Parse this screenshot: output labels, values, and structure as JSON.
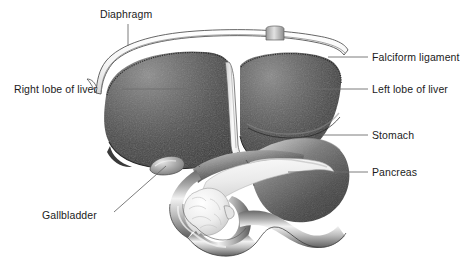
{
  "figure": {
    "background_color": "#ffffff",
    "label_color": "#1b1b1b",
    "leader_color": "#6d6d6d"
  },
  "labels": [
    {
      "id": "diaphragm",
      "text": "Diaphragm",
      "text_x": 100,
      "text_y": 18,
      "anchor": "start",
      "leader": "M128,24 L128,46"
    },
    {
      "id": "falciform-ligament",
      "text": "Falciform ligament",
      "text_x": 372,
      "text_y": 61,
      "anchor": "start",
      "leader": "M368,57 L328,57"
    },
    {
      "id": "right-lobe-of-liver",
      "text": "Right lobe of liver",
      "text_x": 14,
      "text_y": 93,
      "anchor": "start",
      "leader": "M122,89 L186,89"
    },
    {
      "id": "left-lobe-of-liver",
      "text": "Left lobe of liver",
      "text_x": 372,
      "text_y": 93,
      "anchor": "start",
      "leader": "M368,89 L308,89"
    },
    {
      "id": "stomach",
      "text": "Stomach",
      "text_x": 372,
      "text_y": 139,
      "anchor": "start",
      "leader": "M368,135 L322,135"
    },
    {
      "id": "pancreas",
      "text": "Pancreas",
      "text_x": 372,
      "text_y": 176,
      "anchor": "start",
      "leader": "M368,172 L288,172"
    },
    {
      "id": "gallbladder",
      "text": "Gallbladder",
      "text_x": 42,
      "text_y": 219,
      "anchor": "start",
      "leader": "M114,212 L166,166"
    }
  ],
  "structures": [
    {
      "id": "diaphragm",
      "name": "Diaphragm"
    },
    {
      "id": "right-lobe-of-liver",
      "name": "Right lobe of liver"
    },
    {
      "id": "falciform-ligament",
      "name": "Falciform ligament"
    },
    {
      "id": "left-lobe-of-liver",
      "name": "Left lobe of liver"
    },
    {
      "id": "esophagus-stub",
      "name": "Esophagus"
    },
    {
      "id": "stomach",
      "name": "Stomach"
    },
    {
      "id": "pancreas",
      "name": "Pancreas"
    },
    {
      "id": "gallbladder",
      "name": "Gallbladder"
    },
    {
      "id": "duodenum",
      "name": "Duodenum"
    }
  ]
}
